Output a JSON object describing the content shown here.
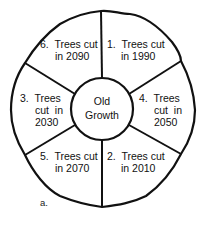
{
  "diagram": {
    "center": {
      "line1": "Old",
      "line2": "Growth"
    },
    "segments": [
      {
        "position": "top-right",
        "lines": [
          "1.  Trees cut",
          "in 1990"
        ]
      },
      {
        "position": "bottom-right",
        "lines": [
          "2.  Trees cut",
          "in 2010"
        ]
      },
      {
        "position": "left",
        "lines": [
          "3.  Trees",
          "cut  in",
          "2030"
        ]
      },
      {
        "position": "right",
        "lines": [
          "4.  Trees",
          "cut  in",
          "2050"
        ]
      },
      {
        "position": "bottom-left",
        "lines": [
          "5.  Trees cut",
          "in 2070"
        ]
      },
      {
        "position": "top-left",
        "lines": [
          "6.  Trees cut",
          "in 2090"
        ]
      }
    ],
    "caption": "a."
  },
  "colors": {
    "stroke": "#111111",
    "background": "#ffffff"
  }
}
